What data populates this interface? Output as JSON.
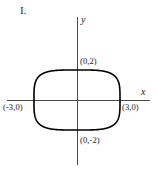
{
  "figure": {
    "problem_number": "I.",
    "axes": {
      "x_axis_label": "x",
      "y_axis_label": "y"
    },
    "point_labels": {
      "top": "(0,2)",
      "bottom": "(0,-2)",
      "left": "(-3,0)",
      "right": "(3,0)"
    },
    "colors": {
      "background": "#ffffff",
      "axis": "#4a4a4a",
      "curve": "#000000",
      "text": "#1a1a1a"
    }
  },
  "chart_data": {
    "type": "line",
    "title": "I.",
    "xlabel": "x",
    "ylabel": "y",
    "grid": false,
    "legend": null,
    "xlim": [
      -4.5,
      4.5
    ],
    "ylim": [
      -3.5,
      3.5
    ],
    "annotations": [
      "(0,2)",
      "(0,-2)",
      "(-3,0)",
      "(3,0)"
    ],
    "curve": {
      "name": "superellipse",
      "semi_axis_x": 3,
      "semi_axis_y": 2,
      "exponent": 4,
      "intercepts_x": [
        -3,
        3
      ],
      "intercepts_y": [
        -2,
        2
      ]
    },
    "x": [
      -3,
      -2.9,
      -2.7,
      -2.4,
      -2,
      -1,
      0,
      1,
      2,
      2.4,
      2.7,
      2.9,
      3
    ],
    "y_upper": [
      0,
      1.03,
      1.41,
      1.68,
      1.85,
      1.99,
      2,
      1.99,
      1.85,
      1.68,
      1.41,
      1.03,
      0
    ],
    "y_lower": [
      0,
      -1.03,
      -1.41,
      -1.68,
      -1.85,
      -1.99,
      -2,
      -1.99,
      -1.85,
      -1.68,
      -1.41,
      -1.03,
      0
    ]
  }
}
